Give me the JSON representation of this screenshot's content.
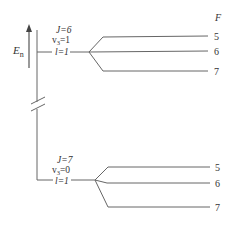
{
  "diagram": {
    "type": "energy-level-diagram",
    "axis": {
      "label": "E",
      "label_subscript": "n"
    },
    "column_header": "F",
    "upper_group": {
      "J_label": "J=6",
      "v_label": "v",
      "v_sub": "3",
      "v_value": "=1",
      "l_label": "l=1",
      "levels": [
        {
          "F": "5"
        },
        {
          "F": "6"
        },
        {
          "F": "7"
        }
      ]
    },
    "lower_group": {
      "J_label": "J=7",
      "v_label": "v",
      "v_sub": "3",
      "v_value": "=0",
      "l_label": "l=1",
      "levels": [
        {
          "F": "5"
        },
        {
          "F": "6"
        },
        {
          "F": "7"
        }
      ]
    },
    "colors": {
      "line": "#555555",
      "text": "#333333"
    }
  }
}
